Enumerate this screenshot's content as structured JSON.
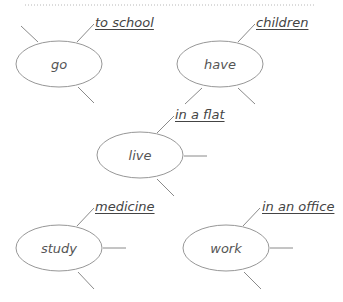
{
  "diagram": {
    "type": "word-web collocations",
    "colors": {
      "line": "#8a8a8a",
      "text": "#555555",
      "divider": "#b8b8b8"
    },
    "nodes": [
      {
        "id": "go",
        "label": "go",
        "cx": 59,
        "cy": 64,
        "collocation": "to school"
      },
      {
        "id": "have",
        "label": "have",
        "cx": 220,
        "cy": 64,
        "collocation": "children"
      },
      {
        "id": "live",
        "label": "live",
        "cx": 140,
        "cy": 155,
        "collocation": "in a flat"
      },
      {
        "id": "study",
        "label": "study",
        "cx": 59,
        "cy": 248,
        "collocation": "medicine"
      },
      {
        "id": "work",
        "label": "work",
        "cx": 226,
        "cy": 248,
        "collocation": "in an office"
      }
    ]
  }
}
